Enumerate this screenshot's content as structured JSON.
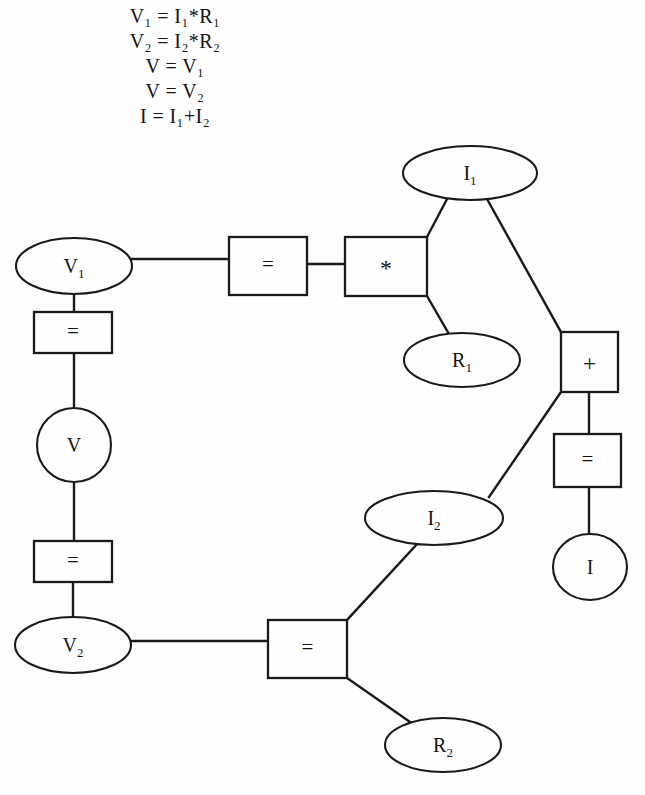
{
  "equations": {
    "lines": [
      {
        "id": "eq1",
        "text": "V₁ = I₁*R₁"
      },
      {
        "id": "eq2",
        "text": "V₂ = I₂*R₂"
      },
      {
        "id": "eq3",
        "text": "V = V₁"
      },
      {
        "id": "eq4",
        "text": "V = V₂"
      },
      {
        "id": "eq5",
        "text": "I = I₁+I₂"
      }
    ]
  },
  "diagram": {
    "stroke_color": "#1a1a1a",
    "fill_color": "#fefefe",
    "nodes": [
      {
        "id": "v1",
        "label": "V₁",
        "shape": "ellipse",
        "cx": 74,
        "cy": 266,
        "rx": 58,
        "ry": 28
      },
      {
        "id": "eq_left_top",
        "label": "=",
        "shape": "box",
        "x": 34,
        "y": 312,
        "w": 78,
        "h": 41
      },
      {
        "id": "v",
        "label": "V",
        "shape": "circle",
        "cx": 74,
        "cy": 445,
        "rx": 37,
        "ry": 37
      },
      {
        "id": "eq_left_bottom",
        "label": "=",
        "shape": "box",
        "x": 34,
        "y": 541,
        "w": 78,
        "h": 41
      },
      {
        "id": "v2",
        "label": "V₂",
        "shape": "ellipse",
        "cx": 73,
        "cy": 645,
        "rx": 58,
        "ry": 28
      },
      {
        "id": "eq_top",
        "label": "=",
        "shape": "box",
        "x": 229,
        "y": 237,
        "w": 78,
        "h": 58
      },
      {
        "id": "mul",
        "label": "*",
        "shape": "box",
        "x": 345,
        "y": 237,
        "w": 82,
        "h": 59
      },
      {
        "id": "i1",
        "label": "I₁",
        "shape": "ellipse",
        "cx": 470,
        "cy": 173,
        "rx": 67,
        "ry": 27
      },
      {
        "id": "r1",
        "label": "R₁",
        "shape": "ellipse",
        "cx": 462,
        "cy": 360,
        "rx": 58,
        "ry": 27
      },
      {
        "id": "plus",
        "label": "+",
        "shape": "box",
        "x": 561,
        "y": 332,
        "w": 57,
        "h": 60
      },
      {
        "id": "eq_right",
        "label": "=",
        "shape": "box",
        "x": 554,
        "y": 434,
        "w": 67,
        "h": 53
      },
      {
        "id": "i",
        "label": "I",
        "shape": "circle",
        "cx": 590,
        "cy": 567,
        "rx": 37,
        "ry": 33
      },
      {
        "id": "i2",
        "label": "I₂",
        "shape": "ellipse",
        "cx": 434,
        "cy": 518,
        "rx": 69,
        "ry": 27
      },
      {
        "id": "eq_bottom",
        "label": "=",
        "shape": "box",
        "x": 268,
        "y": 620,
        "w": 79,
        "h": 58
      },
      {
        "id": "r2",
        "label": "R₂",
        "shape": "ellipse",
        "cx": 443,
        "cy": 745,
        "rx": 58,
        "ry": 27
      }
    ],
    "edges": [
      {
        "id": "e-v1-eqleft",
        "from": "v1",
        "to": "eq_left_top",
        "points": "74,294 74,312"
      },
      {
        "id": "e-eqleft-v",
        "from": "eq_left_top",
        "to": "v",
        "points": "74,353 74,408"
      },
      {
        "id": "e-v-eqleftbottom",
        "from": "v",
        "to": "eq_left_bottom",
        "points": "74,482 74,541"
      },
      {
        "id": "e-eqleftbottom-v2",
        "from": "eq_left_bottom",
        "to": "v2",
        "points": "73,582 73,617"
      },
      {
        "id": "e-v1-eqtop",
        "from": "v1",
        "to": "eq_top",
        "points": "132,259 229,259"
      },
      {
        "id": "e-eqtop-mul",
        "from": "eq_top",
        "to": "mul",
        "points": "307,264 345,264"
      },
      {
        "id": "e-mul-i1",
        "from": "mul",
        "to": "i1",
        "points": "427,237 447,199"
      },
      {
        "id": "e-mul-r1",
        "from": "mul",
        "to": "r1",
        "points": "427,296 449,334"
      },
      {
        "id": "e-i1-plus",
        "from": "i1",
        "to": "plus",
        "points": "487,199 561,332"
      },
      {
        "id": "e-i2-plus",
        "from": "i2",
        "to": "plus",
        "points": "489,497 561,392"
      },
      {
        "id": "e-plus-eqright",
        "from": "plus",
        "to": "eq_right",
        "points": "589,392 589,434"
      },
      {
        "id": "e-eqright-i",
        "from": "eq_right",
        "to": "i",
        "points": "589,487 589,534"
      },
      {
        "id": "e-i2-eqbottom",
        "from": "i2",
        "to": "eq_bottom",
        "points": "419,542 347,620"
      },
      {
        "id": "e-v2-eqbottom",
        "from": "v2",
        "to": "eq_bottom",
        "points": "131,641 268,641"
      },
      {
        "id": "e-eqbottom-r2",
        "from": "eq_bottom",
        "to": "r2",
        "points": "347,678 413,724"
      }
    ]
  }
}
